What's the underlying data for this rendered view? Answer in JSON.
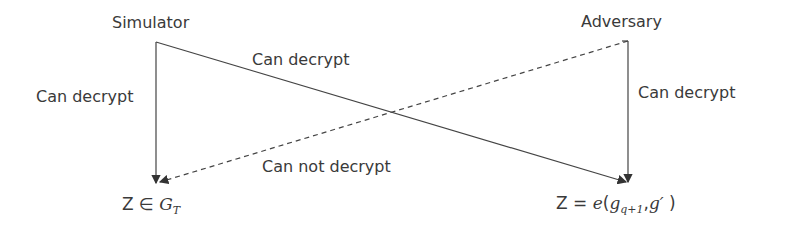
{
  "nodes": {
    "simulator": "Simulator",
    "adversary": "Adversary",
    "left_result_prefix": "Z ∈ ",
    "left_result_group": "G",
    "left_result_sub": "T",
    "right_result_prefix": "Z = ",
    "right_result_fn": "e",
    "right_result_open": "(",
    "right_result_arg1": "g",
    "right_result_arg1_sub": "q+1",
    "right_result_sep": ",",
    "right_result_arg2": "g′",
    "right_result_close": " )"
  },
  "edges": {
    "simulator_to_left": "Can decrypt",
    "simulator_to_right": "Can decrypt",
    "adversary_to_right": "Can decrypt",
    "adversary_to_left": "Can not decrypt"
  },
  "colors": {
    "line": "#444444",
    "text": "#3a3a3a"
  }
}
